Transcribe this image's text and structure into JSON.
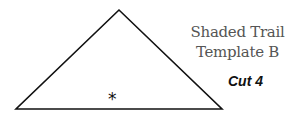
{
  "template": {
    "title_line1": "Shaded Trail",
    "title_line2": "Template B",
    "cut_label": "Cut 4",
    "marker": "*"
  },
  "shape": {
    "type": "triangle",
    "apex": [
      119,
      10
    ],
    "base_left": [
      16,
      109
    ],
    "base_right": [
      222,
      109
    ],
    "stroke": "#111111"
  }
}
